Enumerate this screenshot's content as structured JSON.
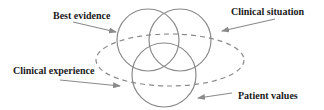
{
  "diagram": {
    "type": "venn",
    "colors": {
      "stroke": "#8a8a8a",
      "text": "#1a1a1a",
      "background": "#ffffff"
    },
    "labels": {
      "best_evidence": "Best evidence",
      "clinical_situation": "Clinical situation",
      "clinical_experience": "Clinical experience",
      "patient_values": "Patient values"
    },
    "sets": [
      {
        "name": "Best evidence",
        "shape": "circle",
        "style": "solid"
      },
      {
        "name": "Clinical situation",
        "shape": "circle",
        "style": "solid"
      },
      {
        "name": "Patient values",
        "shape": "circle",
        "style": "solid"
      },
      {
        "name": "Clinical experience",
        "shape": "ellipse",
        "style": "dashed"
      }
    ]
  }
}
